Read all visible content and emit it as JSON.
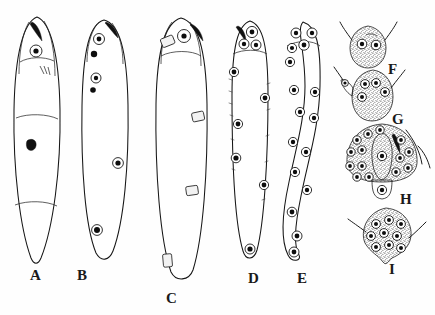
{
  "figure": {
    "kind": "scientific-illustration",
    "background_color": "#fefefe",
    "ink_color": "#161616",
    "stipple_color": "#5a5a5a",
    "nucleus_fill": "#0d0d0d",
    "panels": [
      {
        "id": "A",
        "label": "A",
        "label_x": 30,
        "label_y": 268,
        "type": "whole-body-lateral",
        "description": "elongate leaf-shaped body, pointed posterior, single anterior nucleus, dark apical hook, broad stippled mid-region with one dark inclusion",
        "body": {
          "cx": 37,
          "top": 17,
          "bottom": 265,
          "max_width": 46
        },
        "nuclei": 1,
        "dark_inclusions": 2,
        "stipple_zones": 2
      },
      {
        "id": "B",
        "label": "B",
        "label_x": 77,
        "label_y": 268,
        "type": "whole-body-lateral",
        "description": "elongate body with stippled anterior cap, four nucleated cell clusters spaced along body, blunt posterior",
        "body": {
          "cx": 105,
          "top": 20,
          "bottom": 262,
          "max_width": 44
        },
        "nuclei": 6,
        "dark_inclusions": 3,
        "stipple_zones": 4
      },
      {
        "id": "C",
        "label": "C",
        "label_x": 166,
        "label_y": 291,
        "type": "whole-body-lateral",
        "description": "longest specimen, anterior head with paired organs, two wavy lateral stippled bands with rectangular organ bodies, stippled posterior cap",
        "body": {
          "cx": 181,
          "top": 18,
          "bottom": 283,
          "max_width": 48
        },
        "nuclei": 2,
        "dark_inclusions": 1,
        "stipple_zones": 5
      },
      {
        "id": "D",
        "label": "D",
        "label_x": 248,
        "label_y": 271,
        "type": "whole-body-lateral",
        "description": "slender body with stippled anterior cap bearing three ringed nuclei and a dark apical mark; seven scattered dark marginal nuclei along the body",
        "body": {
          "cx": 250,
          "top": 21,
          "bottom": 263,
          "max_width": 34
        },
        "nuclei": 10,
        "dark_inclusions": 8,
        "stipple_zones": 1
      },
      {
        "id": "E",
        "label": "E",
        "label_x": 297,
        "label_y": 271,
        "type": "whole-body-lateral",
        "description": "sigmoid slender body, stippled anterior cap with four ringed nuclei, about twelve ringed nuclei distributed in two rows down the body",
        "body": {
          "cx": 305,
          "top": 22,
          "bottom": 261,
          "max_width": 32
        },
        "nuclei": 16,
        "dark_inclusions": 0,
        "stipple_zones": 1
      },
      {
        "id": "F",
        "label": "F",
        "label_x": 388,
        "label_y": 62,
        "type": "anterior-detail",
        "description": "detached stippled anterior cone with two ringed nuclei and a pair of flanking setae",
        "body": {
          "cx": 368,
          "top": 26,
          "bottom": 68,
          "max_width": 36
        },
        "nuclei": 2,
        "dark_inclusions": 0,
        "stipple_zones": 1
      },
      {
        "id": "G",
        "label": "G",
        "label_x": 392,
        "label_y": 112,
        "type": "anterior-detail",
        "description": "detached stippled anterior with four ringed nuclei, a lateral lobe bearing one nucleus, and two flanking setae",
        "body": {
          "cx": 372,
          "top": 70,
          "bottom": 120,
          "max_width": 40
        },
        "nuclei": 5,
        "dark_inclusions": 0,
        "stipple_zones": 2
      },
      {
        "id": "H",
        "label": "H",
        "label_x": 400,
        "label_y": 192,
        "type": "anterior-detail",
        "description": "broad stippled anterior dome with a central pale tongue-shaped organ, dark apical hook, an arc of about fourteen ringed nuclei, a ventral lobe with one nucleus and lateral setae",
        "body": {
          "cx": 382,
          "top": 124,
          "bottom": 196,
          "max_width": 68
        },
        "nuclei": 16,
        "dark_inclusions": 1,
        "stipple_zones": 2
      },
      {
        "id": "I",
        "label": "I",
        "label_x": 389,
        "label_y": 262,
        "type": "anterior-detail",
        "description": "rounded stippled anterior with a short ventral tail process, nine ringed nuclei and two flanking setae",
        "body": {
          "cx": 386,
          "top": 208,
          "bottom": 262,
          "max_width": 46
        },
        "nuclei": 9,
        "dark_inclusions": 0,
        "stipple_zones": 1
      }
    ]
  }
}
